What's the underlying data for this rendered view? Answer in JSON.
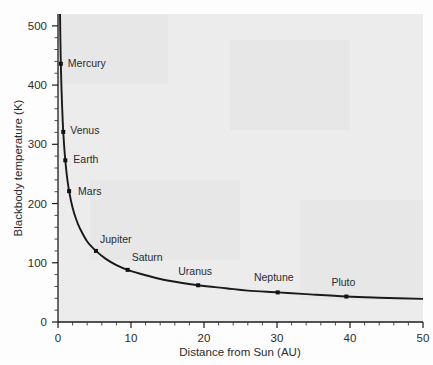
{
  "chart_data": {
    "type": "line",
    "title": "",
    "xlabel": "Distance from Sun (AU)",
    "ylabel": "Blackbody temperature (K)",
    "xlim": [
      0,
      50
    ],
    "ylim": [
      0,
      520
    ],
    "x_ticks": [
      0,
      10,
      20,
      30,
      40,
      50
    ],
    "y_ticks": [
      0,
      100,
      200,
      300,
      400,
      500
    ],
    "x_tick_labels": [
      "0",
      "10",
      "20",
      "30",
      "40",
      "50"
    ],
    "y_tick_labels": [
      "0",
      "100",
      "200",
      "300",
      "400",
      "500"
    ],
    "x_minor_step": 2,
    "y_minor_step": 20,
    "grid": false,
    "legend": "none",
    "curve_description": "Blackbody equilibrium temperature falls as inverse square root of distance from the Sun",
    "curve_points": [
      {
        "x": 0.25,
        "y": 545
      },
      {
        "x": 0.3,
        "y": 498
      },
      {
        "x": 0.35,
        "y": 461
      },
      {
        "x": 0.39,
        "y": 436
      },
      {
        "x": 0.45,
        "y": 406
      },
      {
        "x": 0.55,
        "y": 368
      },
      {
        "x": 0.65,
        "y": 338
      },
      {
        "x": 0.72,
        "y": 321
      },
      {
        "x": 0.85,
        "y": 296
      },
      {
        "x": 1.0,
        "y": 273
      },
      {
        "x": 1.2,
        "y": 249
      },
      {
        "x": 1.52,
        "y": 221
      },
      {
        "x": 2.0,
        "y": 193
      },
      {
        "x": 2.5,
        "y": 173
      },
      {
        "x": 3.0,
        "y": 158
      },
      {
        "x": 4.0,
        "y": 136
      },
      {
        "x": 5.2,
        "y": 120
      },
      {
        "x": 6.5,
        "y": 107
      },
      {
        "x": 8.0,
        "y": 96
      },
      {
        "x": 9.54,
        "y": 88
      },
      {
        "x": 12.0,
        "y": 79
      },
      {
        "x": 15.0,
        "y": 70
      },
      {
        "x": 19.2,
        "y": 62
      },
      {
        "x": 23.0,
        "y": 57
      },
      {
        "x": 26.0,
        "y": 53
      },
      {
        "x": 30.1,
        "y": 50
      },
      {
        "x": 34.0,
        "y": 47
      },
      {
        "x": 39.5,
        "y": 43
      },
      {
        "x": 44.0,
        "y": 41
      },
      {
        "x": 50.0,
        "y": 39
      }
    ],
    "points": [
      {
        "name": "Mercury",
        "x": 0.39,
        "y": 436,
        "label_dx": 7,
        "label_dy": 3
      },
      {
        "name": "Venus",
        "x": 0.72,
        "y": 321,
        "label_dx": 7,
        "label_dy": 2
      },
      {
        "name": "Earth",
        "x": 1.0,
        "y": 273,
        "label_dx": 8,
        "label_dy": 3
      },
      {
        "name": "Mars",
        "x": 1.52,
        "y": 221,
        "label_dx": 9,
        "label_dy": 4
      },
      {
        "name": "Jupiter",
        "x": 5.2,
        "y": 120,
        "label_dx": 4,
        "label_dy": -8
      },
      {
        "name": "Saturn",
        "x": 9.54,
        "y": 88,
        "label_dx": 4,
        "label_dy": -9
      },
      {
        "name": "Uranus",
        "x": 19.2,
        "y": 62,
        "label_dx": -3,
        "label_dy": -10
      },
      {
        "name": "Neptune",
        "x": 30.1,
        "y": 50,
        "label_dx": -4,
        "label_dy": -11
      },
      {
        "name": "Pluto",
        "x": 39.5,
        "y": 43,
        "label_dx": -3,
        "label_dy": -11
      }
    ]
  },
  "axes": {
    "x_title": "Distance from Sun (AU)",
    "y_title": "Blackbody temperature (K)"
  }
}
